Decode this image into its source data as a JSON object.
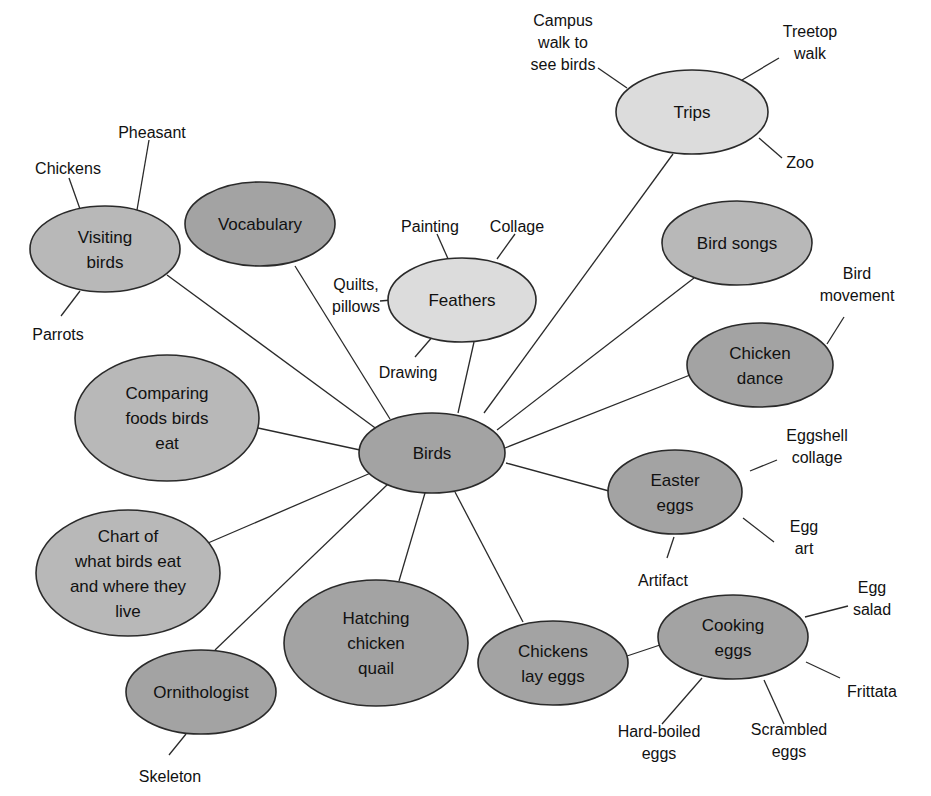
{
  "diagram": {
    "title": "Web of Activity and Learning",
    "colors": {
      "background": "#ffffff",
      "stroke": "#2a2a2a",
      "text": "#111111",
      "fill_light": "#dcdcdc",
      "fill_medium": "#b8b8b8",
      "fill_dark": "#a3a3a3"
    },
    "center": {
      "id": "birds",
      "label": [
        "Birds"
      ],
      "cx": 432,
      "cy": 453,
      "rx": 73,
      "ry": 40,
      "fill": "#a3a3a3"
    },
    "nodes": [
      {
        "id": "trips",
        "label": [
          "Trips"
        ],
        "cx": 692,
        "cy": 112,
        "rx": 76,
        "ry": 42,
        "fill": "#dcdcdc",
        "leaves": [
          {
            "label": [
              "Campus",
              "walk to",
              "see birds"
            ],
            "x": 563,
            "y": 42,
            "line": [
              598,
              68,
              627,
              88
            ]
          },
          {
            "label": [
              "Treetop",
              "walk"
            ],
            "x": 810,
            "y": 42,
            "line": [
              779,
              58,
              742,
              80
            ]
          },
          {
            "label": [
              "Zoo"
            ],
            "x": 800,
            "y": 162,
            "line": [
              759,
              138,
              782,
              158
            ]
          }
        ]
      },
      {
        "id": "visiting-birds",
        "label": [
          "Visiting",
          "birds"
        ],
        "cx": 105,
        "cy": 249,
        "rx": 75,
        "ry": 43,
        "fill": "#b8b8b8",
        "leaves": [
          {
            "label": [
              "Pheasant"
            ],
            "x": 152,
            "y": 132,
            "line": [
              149,
              140,
              137,
              210
            ]
          },
          {
            "label": [
              "Chickens"
            ],
            "x": 68,
            "y": 168,
            "line": [
              69,
              178,
              80,
              209
            ]
          },
          {
            "label": [
              "Parrots"
            ],
            "x": 58,
            "y": 334,
            "line": [
              61,
              316,
              80,
              291
            ]
          }
        ]
      },
      {
        "id": "vocabulary",
        "label": [
          "Vocabulary"
        ],
        "cx": 260,
        "cy": 224,
        "rx": 75,
        "ry": 42,
        "fill": "#a3a3a3",
        "leaves": []
      },
      {
        "id": "feathers",
        "label": [
          "Feathers"
        ],
        "cx": 462,
        "cy": 300,
        "rx": 74,
        "ry": 42,
        "fill": "#dcdcdc",
        "leaves": [
          {
            "label": [
              "Painting"
            ],
            "x": 430,
            "y": 226,
            "line": [
              437,
              234,
              449,
              261
            ]
          },
          {
            "label": [
              "Collage"
            ],
            "x": 517,
            "y": 226,
            "line": [
              515,
              234,
              497,
              259
            ]
          },
          {
            "label": [
              "Quilts,",
              "pillows"
            ],
            "x": 356,
            "y": 295,
            "line": [
              380,
              301,
              404,
              299
            ]
          },
          {
            "label": [
              "Drawing"
            ],
            "x": 408,
            "y": 372,
            "line": [
              415,
              357,
              434,
              335
            ]
          }
        ]
      },
      {
        "id": "bird-songs",
        "label": [
          "Bird songs"
        ],
        "cx": 737,
        "cy": 243,
        "rx": 75,
        "ry": 42,
        "fill": "#b8b8b8",
        "leaves": []
      },
      {
        "id": "chicken-dance",
        "label": [
          "Chicken",
          "dance"
        ],
        "cx": 760,
        "cy": 365,
        "rx": 73,
        "ry": 42,
        "fill": "#a3a3a3",
        "leaves": [
          {
            "label": [
              "Bird",
              "movement"
            ],
            "x": 857,
            "y": 284,
            "line": [
              844,
              317,
              827,
              344
            ]
          }
        ]
      },
      {
        "id": "comparing-foods",
        "label": [
          "Comparing",
          "foods birds",
          "eat"
        ],
        "cx": 167,
        "cy": 418,
        "rx": 92,
        "ry": 63,
        "fill": "#b8b8b8",
        "leaves": []
      },
      {
        "id": "easter-eggs",
        "label": [
          "Easter",
          "eggs"
        ],
        "cx": 675,
        "cy": 492,
        "rx": 67,
        "ry": 42,
        "fill": "#a3a3a3",
        "leaves": [
          {
            "label": [
              "Eggshell",
              "collage"
            ],
            "x": 817,
            "y": 446,
            "line": [
              777,
              460,
              750,
              471
            ]
          },
          {
            "label": [
              "Egg",
              "art"
            ],
            "x": 804,
            "y": 537,
            "line": [
              774,
              542,
              743,
              518
            ]
          },
          {
            "label": [
              "Artifact"
            ],
            "x": 663,
            "y": 580,
            "line": [
              667,
              558,
              674,
              537
            ]
          }
        ]
      },
      {
        "id": "chart-birds-eat",
        "label": [
          "Chart of",
          "what birds eat",
          "and where they",
          "live"
        ],
        "cx": 128,
        "cy": 573,
        "rx": 92,
        "ry": 63,
        "fill": "#b8b8b8",
        "leaves": []
      },
      {
        "id": "hatching",
        "label": [
          "Hatching",
          "chicken",
          "quail"
        ],
        "cx": 376,
        "cy": 643,
        "rx": 92,
        "ry": 63,
        "fill": "#a3a3a3",
        "leaves": []
      },
      {
        "id": "chickens-lay-eggs",
        "label": [
          "Chickens",
          "lay eggs"
        ],
        "cx": 553,
        "cy": 663,
        "rx": 75,
        "ry": 42,
        "fill": "#a3a3a3",
        "leaves": []
      },
      {
        "id": "cooking-eggs",
        "label": [
          "Cooking",
          "eggs"
        ],
        "cx": 733,
        "cy": 637,
        "rx": 75,
        "ry": 42,
        "fill": "#a3a3a3",
        "leaves": [
          {
            "label": [
              "Egg",
              "salad"
            ],
            "x": 872,
            "y": 598,
            "line": [
              848,
              606,
              805,
              617
            ]
          },
          {
            "label": [
              "Frittata"
            ],
            "x": 872,
            "y": 691,
            "line": [
              840,
              678,
              806,
              662
            ]
          },
          {
            "label": [
              "Hard-boiled",
              "eggs"
            ],
            "x": 659,
            "y": 742,
            "line": [
              662,
              724,
              702,
              678
            ]
          },
          {
            "label": [
              "Scrambled",
              "eggs"
            ],
            "x": 789,
            "y": 740,
            "line": [
              784,
              724,
              764,
              680
            ]
          }
        ]
      },
      {
        "id": "ornithologist",
        "label": [
          "Ornithologist"
        ],
        "cx": 201,
        "cy": 692,
        "rx": 75,
        "ry": 42,
        "fill": "#a3a3a3",
        "leaves": [
          {
            "label": [
              "Skeleton"
            ],
            "x": 170,
            "y": 776,
            "line": [
              169,
              755,
              186,
              734
            ]
          }
        ]
      }
    ],
    "center_edges": [
      {
        "to": "trips",
        "line": [
          484,
          413,
          673,
          154
        ]
      },
      {
        "to": "visiting-birds",
        "line": [
          378,
          430,
          167,
          275
        ]
      },
      {
        "to": "vocabulary",
        "line": [
          390,
          419,
          295,
          266
        ]
      },
      {
        "to": "feathers",
        "line": [
          458,
          413,
          474,
          342
        ]
      },
      {
        "to": "bird-songs",
        "line": [
          497,
          430,
          694,
          278
        ]
      },
      {
        "to": "chicken-dance",
        "line": [
          505,
          448,
          690,
          375
        ]
      },
      {
        "to": "comparing-foods",
        "line": [
          360,
          450,
          258,
          428
        ]
      },
      {
        "to": "easter-eggs",
        "line": [
          506,
          463,
          609,
          491
        ]
      },
      {
        "to": "chart-birds-eat",
        "line": [
          373,
          472,
          208,
          543
        ]
      },
      {
        "to": "hatching",
        "line": [
          425,
          493,
          399,
          581
        ]
      },
      {
        "to": "chickens-lay-eggs",
        "line": [
          455,
          492,
          523,
          622
        ]
      },
      {
        "to": "ornithologist",
        "line": [
          388,
          484,
          215,
          650
        ]
      }
    ],
    "extra_edges": [
      {
        "from": "chickens-lay-eggs",
        "to": "cooking-eggs",
        "line": [
          627,
          656,
          660,
          645
        ]
      }
    ]
  }
}
